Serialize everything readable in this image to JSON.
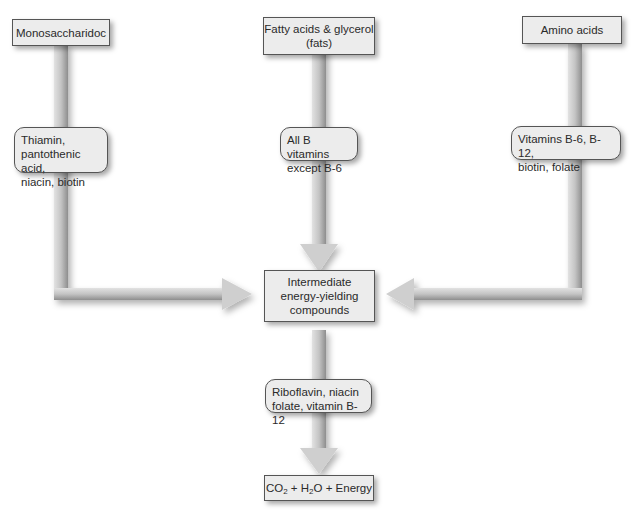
{
  "diagram": {
    "sources": [
      {
        "id": "monosaccharides",
        "label": "Monosaccharidoc"
      },
      {
        "id": "fats",
        "label_lines": [
          "Fatty acids & glycerol",
          "(fats)"
        ]
      },
      {
        "id": "amino",
        "label": "Amino acids"
      }
    ],
    "cofactors": [
      {
        "id": "mono-vitamins",
        "lines": [
          "Thiamin,",
          "pantothenic acid,",
          "niacin, biotin"
        ]
      },
      {
        "id": "fat-vitamins",
        "lines": [
          "All B vitamins",
          "except B-6"
        ]
      },
      {
        "id": "amino-vitamins",
        "lines": [
          "Vitamins B-6, B-12,",
          "biotin, folate"
        ]
      }
    ],
    "intermediate": {
      "lines": [
        "Intermediate",
        "energy-yielding",
        "compounds"
      ]
    },
    "final_cofactor": {
      "lines": [
        "Riboflavin, niacin",
        "folate, vitamin B-12"
      ]
    },
    "product": {
      "co2": "CO",
      "co2_sub": "2",
      "plus1": " + H",
      "h2o_sub": "2",
      "tail": "O + Energy"
    },
    "colors": {
      "arrow_light": "#d8d8d8",
      "arrow_dark": "#9a9a9a",
      "box_fill": "#ececec",
      "box_border": "#555555"
    }
  }
}
